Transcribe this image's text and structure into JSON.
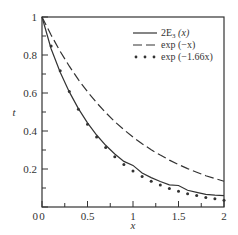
{
  "chart_data": {
    "type": "line",
    "title": "",
    "xlabel": "x",
    "ylabel": "t",
    "xlim": [
      0,
      2
    ],
    "ylim": [
      0,
      1
    ],
    "grid": false,
    "legend_position": "upper right",
    "x_ticks": [
      0,
      0.5,
      1,
      1.5,
      2
    ],
    "x_tick_labels": [
      "0",
      "0.5",
      "1",
      "1.5",
      "2"
    ],
    "y_ticks": [
      0,
      0.2,
      0.4,
      0.6,
      0.8,
      1
    ],
    "y_tick_labels": [
      "0",
      "0.2",
      "0.4",
      "0.6",
      "0.8",
      "1"
    ],
    "x": [
      0,
      0.1,
      0.2,
      0.3,
      0.4,
      0.5,
      0.6,
      0.7,
      0.8,
      0.9,
      1.0,
      1.1,
      1.2,
      1.3,
      1.4,
      1.5,
      1.6,
      1.7,
      1.8,
      1.9,
      2.0
    ],
    "series": [
      {
        "name": "2E₃(x)",
        "style": "solid",
        "values": [
          1.0,
          0.833,
          0.709,
          0.606,
          0.518,
          0.443,
          0.379,
          0.325,
          0.279,
          0.24,
          0.219,
          0.179,
          0.155,
          0.134,
          0.117,
          0.113,
          0.088,
          0.077,
          0.067,
          0.062,
          0.06
        ]
      },
      {
        "name": "exp(−x)",
        "style": "dashed",
        "values": [
          1.0,
          0.905,
          0.819,
          0.741,
          0.67,
          0.607,
          0.549,
          0.497,
          0.449,
          0.407,
          0.368,
          0.333,
          0.301,
          0.273,
          0.247,
          0.223,
          0.202,
          0.183,
          0.165,
          0.15,
          0.135
        ]
      },
      {
        "name": "exp(−1.66x)",
        "style": "dotted",
        "values": [
          1.0,
          0.847,
          0.717,
          0.608,
          0.515,
          0.436,
          0.369,
          0.313,
          0.265,
          0.224,
          0.19,
          0.161,
          0.136,
          0.116,
          0.098,
          0.083,
          0.07,
          0.06,
          0.05,
          0.043,
          0.036
        ]
      }
    ]
  },
  "legend": {
    "items": [
      {
        "label_main": "2E",
        "label_sub": "3",
        "label_tail": " (x)"
      },
      {
        "label_main": "exp (−x)"
      },
      {
        "label_main": "exp (−1.66x)"
      }
    ]
  }
}
